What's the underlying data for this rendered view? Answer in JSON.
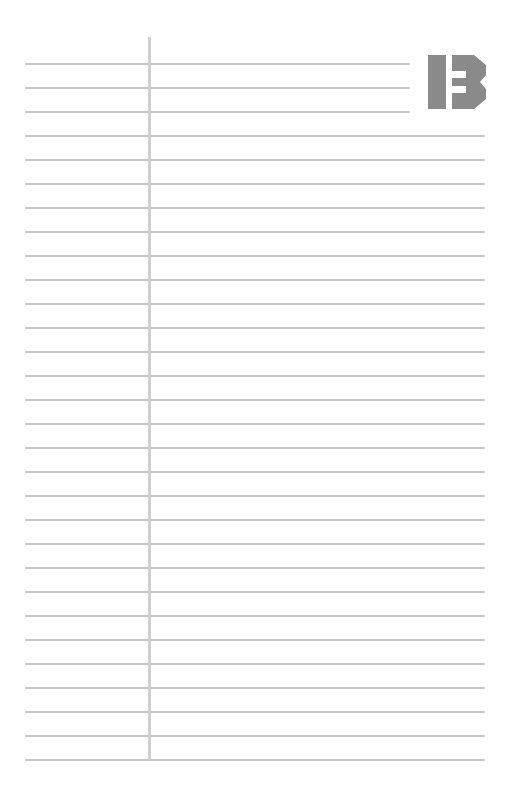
{
  "page": {
    "type": "lined-notebook-page",
    "rule_color": "#c9c9c9",
    "margin_color": "#cfcfcf",
    "logo": {
      "icon": "ib-logo-icon",
      "color": "#8a8a8a"
    },
    "line_count": 30,
    "first_line_y": 63,
    "line_spacing": 24,
    "short_lines": 3
  }
}
